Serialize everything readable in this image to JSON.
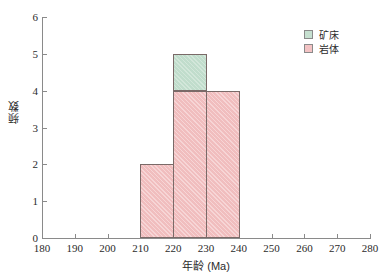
{
  "chart_data": {
    "type": "bar",
    "title": "",
    "subtitle": "",
    "xlabel": "年龄 (Ma)",
    "ylabel": "频数",
    "xlim": [
      180,
      280
    ],
    "ylim": [
      0,
      6
    ],
    "xticks": [
      180,
      190,
      200,
      210,
      220,
      230,
      240,
      250,
      260,
      270,
      280
    ],
    "yticks": [
      0,
      1,
      2,
      3,
      4,
      5,
      6
    ],
    "grid": false,
    "bin_width": 10,
    "legend_position": "top-right",
    "stacked": true,
    "bins": [
      {
        "start": 210,
        "end": 220,
        "rock": 2,
        "deposit": 0,
        "total": 2
      },
      {
        "start": 220,
        "end": 230,
        "rock": 4,
        "deposit": 1,
        "total": 5
      },
      {
        "start": 230,
        "end": 240,
        "rock": 4,
        "deposit": 0,
        "total": 4
      }
    ],
    "categories": [
      "210-220",
      "220-230",
      "230-240"
    ],
    "series": [
      {
        "name": "岩体",
        "values": [
          2,
          4,
          4
        ],
        "color": "#f3c3c4"
      },
      {
        "name": "矿床",
        "values": [
          0,
          1,
          0
        ],
        "color": "#c6e0d0"
      }
    ]
  },
  "legend": {
    "items": [
      {
        "label": "矿床",
        "color": "#c6e0d0"
      },
      {
        "label": "岩体",
        "color": "#f3c3c4"
      }
    ]
  },
  "axes": {
    "x_title": "年龄 (Ma)",
    "y_title": "频数",
    "x_tick_labels": [
      "180",
      "190",
      "200",
      "210",
      "220",
      "230",
      "240",
      "250",
      "260",
      "270",
      "280"
    ],
    "y_tick_labels": [
      "0",
      "1",
      "2",
      "3",
      "4",
      "5",
      "6"
    ]
  },
  "colors": {
    "axis": "#8a8a8a",
    "bar_border": "#7a6a68",
    "rock": "#f3c3c4",
    "deposit": "#c6e0d0",
    "text": "#2b2b2b",
    "background": "#ffffff"
  }
}
